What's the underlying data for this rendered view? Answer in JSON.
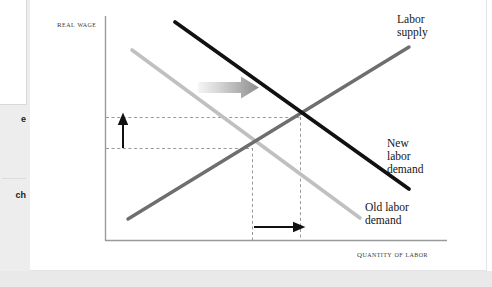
{
  "figure": {
    "type": "economics-supply-demand-diagram",
    "axes": {
      "y_label": "Real wage",
      "x_label": "Quantity of labor",
      "axis_color": "#9a9a9a"
    },
    "series": [
      {
        "id": "labor-supply",
        "label": "Labor\nsupply",
        "color": "#6e6e6e",
        "slope": "upward"
      },
      {
        "id": "old-labor-demand",
        "label": "Old labor\ndemand",
        "color": "#c0c0c0",
        "slope": "downward"
      },
      {
        "id": "new-labor-demand",
        "label": "New\nlabor\ndemand",
        "color": "#111111",
        "slope": "downward"
      }
    ],
    "annotations": {
      "shift_arrow": {
        "id": "demand-shift-arrow",
        "direction": "right",
        "color_start": "#f2f2f2",
        "color_end": "#8c8c8c"
      },
      "wage_increase_arrow": {
        "id": "wage-increase-arrow",
        "direction": "up",
        "color": "#111111"
      },
      "quantity_increase_arrow": {
        "id": "quantity-increase-arrow",
        "direction": "right",
        "color": "#111111"
      },
      "guide_lines": {
        "id": "equilibrium-guide-lines",
        "style": "dashed",
        "color": "#9a9a9a"
      }
    }
  },
  "sidebar": {
    "clipped_line_1": "e",
    "clipped_line_2": "ch"
  }
}
